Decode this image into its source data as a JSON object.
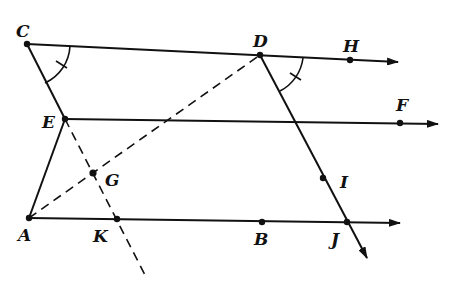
{
  "diagram": {
    "stroke_color": "#111111",
    "points": {
      "C": {
        "label": "C",
        "x": 27,
        "y": 44,
        "lx": 16,
        "ly": 37
      },
      "D": {
        "label": "D",
        "x": 260,
        "y": 55,
        "lx": 253,
        "ly": 47
      },
      "H": {
        "label": "H",
        "x": 350,
        "y": 60,
        "lx": 343,
        "ly": 52
      },
      "E": {
        "label": "E",
        "x": 65,
        "y": 119,
        "lx": 42,
        "ly": 128
      },
      "F": {
        "label": "F",
        "x": 400,
        "y": 123,
        "lx": 396,
        "ly": 111
      },
      "G": {
        "label": "G",
        "x": 93,
        "y": 173,
        "lx": 105,
        "ly": 186
      },
      "I": {
        "label": "I",
        "x": 323,
        "y": 178,
        "lx": 340,
        "ly": 188
      },
      "A": {
        "label": "A",
        "x": 29,
        "y": 218,
        "lx": 18,
        "ly": 241
      },
      "K": {
        "label": "K",
        "x": 117,
        "y": 219,
        "lx": 93,
        "ly": 242
      },
      "B": {
        "label": "B",
        "x": 262,
        "y": 222,
        "lx": 254,
        "ly": 245
      },
      "J": {
        "label": "J",
        "x": 347,
        "y": 222,
        "lx": 331,
        "ly": 245
      }
    },
    "rays": [
      {
        "name": "ray-CH",
        "from": "C",
        "to": [
          398,
          62
        ]
      },
      {
        "name": "ray-EF",
        "from": "E",
        "to": [
          438,
          124
        ]
      },
      {
        "name": "ray-AJ",
        "from": "A",
        "to": [
          400,
          223
        ]
      },
      {
        "name": "ray-DJ",
        "from": "D",
        "to": [
          367,
          258
        ]
      }
    ],
    "segments": [
      {
        "name": "segment-CE",
        "from": "C",
        "to": "E"
      },
      {
        "name": "segment-EA",
        "from": "E",
        "to": "A"
      }
    ],
    "dashed": [
      {
        "name": "dashed-AD",
        "from": "A",
        "to": "D"
      },
      {
        "name": "dashed-EK-extended",
        "from": "E",
        "to": [
          145,
          275
        ]
      }
    ],
    "angle_marks": [
      {
        "name": "angle-mark-ECD",
        "vertex": "C"
      },
      {
        "name": "angle-mark-HDJ",
        "vertex": "D"
      }
    ]
  }
}
